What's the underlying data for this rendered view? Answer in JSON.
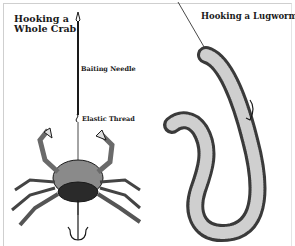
{
  "figure": {
    "panels": [
      {
        "id": "crab",
        "title_line1": "Hooking a",
        "title_line2": "Whole Crab",
        "annotations": [
          "Baiting Needle",
          "Elastic Thread"
        ]
      },
      {
        "id": "lugworm",
        "title": "Hooking a Lugworm"
      }
    ],
    "colors": {
      "ink": "#1a1a1a",
      "background": "#ffffff",
      "frame": "#cfcfcf"
    }
  }
}
